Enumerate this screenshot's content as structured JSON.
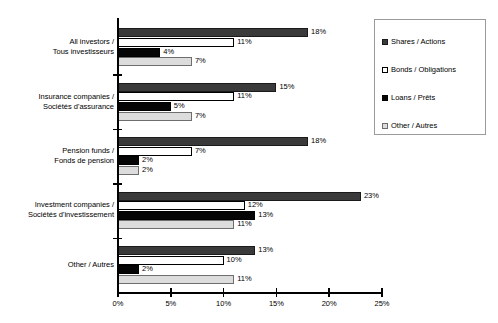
{
  "chart_data": {
    "type": "bar",
    "orientation": "horizontal",
    "title": "",
    "xlabel": "",
    "ylabel": "",
    "xlim": [
      0,
      25
    ],
    "xticks": [
      "0%",
      "5%",
      "10%",
      "15%",
      "20%",
      "25%"
    ],
    "xtick_values": [
      0,
      5,
      10,
      15,
      20,
      25
    ],
    "grid": false,
    "legend_position": "upper right",
    "value_suffix": "%",
    "categories": [
      "All investors /\nTous investisseurs",
      "Insurance companies /\nSociétés d'assurance",
      "Pension funds /\nFonds de pension",
      "Investment companies /\nSociétés d'investissement",
      "Other / Autres"
    ],
    "category_lines": [
      [
        "All investors /",
        "Tous investisseurs"
      ],
      [
        "Insurance companies /",
        "Sociétés d'assurance"
      ],
      [
        "Pension funds /",
        "Fonds de pension"
      ],
      [
        "Investment companies /",
        "Sociétés d'investissement"
      ],
      [
        "Other / Autres",
        ""
      ]
    ],
    "series": [
      {
        "name": "Shares / Actions",
        "color": "#3a3a3a",
        "values": [
          18,
          15,
          18,
          23,
          13
        ],
        "labels": [
          "18%",
          "15%",
          "18%",
          "23%",
          "13%"
        ]
      },
      {
        "name": "Bonds / Obligations",
        "color": "#ffffff",
        "values": [
          11,
          11,
          7,
          12,
          10
        ],
        "labels": [
          "11%",
          "11%",
          "7%",
          "12%",
          "10%"
        ]
      },
      {
        "name": "Loans / Prêts",
        "color": "#050505",
        "values": [
          4,
          5,
          2,
          13,
          2
        ],
        "labels": [
          "4%",
          "5%",
          "2%",
          "13%",
          "2%"
        ]
      },
      {
        "name": "Other / Autres",
        "color": "#dcdcdc",
        "values": [
          7,
          7,
          2,
          11,
          11
        ],
        "labels": [
          "7%",
          "7%",
          "2%",
          "11%",
          "11%"
        ]
      }
    ]
  },
  "legend": {
    "items": [
      {
        "label": "Shares / Actions"
      },
      {
        "label": "Bonds / Obligations"
      },
      {
        "label": "Loans / Prêts"
      },
      {
        "label": "Other / Autres"
      }
    ]
  }
}
